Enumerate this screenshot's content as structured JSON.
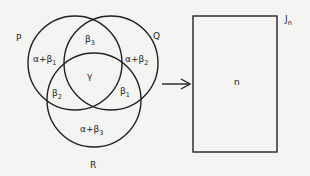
{
  "diagram": {
    "sets": [
      {
        "name": "P",
        "label": "P"
      },
      {
        "name": "Q",
        "label": "Q"
      },
      {
        "name": "R",
        "label": "R"
      }
    ],
    "regions": {
      "p_only": {
        "main": "α+β",
        "sub": "1"
      },
      "q_only": {
        "main": "α+β",
        "sub": "2"
      },
      "r_only": {
        "main": "α+β",
        "sub": "3"
      },
      "p_and_q": {
        "main": "β",
        "sub": "3"
      },
      "p_and_r": {
        "main": "β",
        "sub": "2"
      },
      "q_and_r": {
        "main": "β",
        "sub": "1"
      },
      "p_q_r": {
        "main": "γ"
      }
    },
    "arrow": {
      "direction": "right"
    },
    "target": {
      "label_main": "J",
      "label_sub": "n",
      "content": "n"
    },
    "colors": {
      "line": "#222222",
      "background": "#f4f4f2"
    }
  }
}
